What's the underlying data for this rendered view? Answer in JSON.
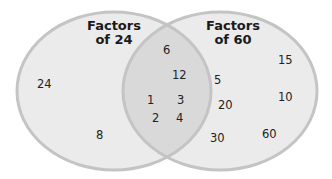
{
  "colors": {
    "background": "#ffffff",
    "circle_fill": "#ebebeb",
    "overlap_fill": "#d9d9d9",
    "circle_stroke": "#c4c4c4",
    "text": "#222222"
  },
  "left_set": {
    "title_line1": "Factors",
    "title_line2": "of 24",
    "only": [
      "24",
      "8"
    ]
  },
  "right_set": {
    "title_line1": "Factors",
    "title_line2": "of 60",
    "only": [
      "15",
      "5",
      "10",
      "20",
      "30",
      "60"
    ]
  },
  "intersection": [
    "6",
    "12",
    "1",
    "3",
    "2",
    "4"
  ]
}
